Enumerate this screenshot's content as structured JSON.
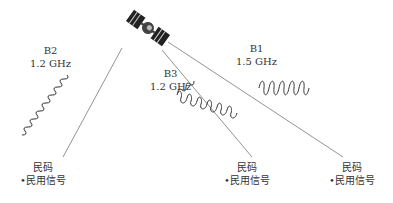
{
  "bands": [
    {
      "name": "B2",
      "freq": "1.2 GHz"
    },
    {
      "name": "B3",
      "freq": "1.2 GHz"
    },
    {
      "name": "B1",
      "freq": "1.5 GHz"
    }
  ],
  "receivers": [
    {
      "title": "民码",
      "item": "•民用信号"
    },
    {
      "title": "民码",
      "item": "•民用信号"
    },
    {
      "title": "民码",
      "item": "•民用信号"
    }
  ]
}
